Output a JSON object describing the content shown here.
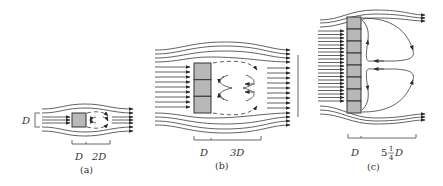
{
  "figure": {
    "panels": [
      {
        "id": "a",
        "caption": "(a)",
        "plate_cells": 1,
        "height_label": "D",
        "dim_labels": [
          "D",
          "2D"
        ],
        "wake_length": "2D"
      },
      {
        "id": "b",
        "caption": "(b)",
        "plate_cells": 3,
        "dim_labels": [
          "D",
          "3D"
        ],
        "wake_length": "3D"
      },
      {
        "id": "c",
        "caption": "(c)",
        "plate_cells": 8,
        "dim_labels": [
          "D",
          "5"
        ],
        "frac_num": "1",
        "frac_den": "4",
        "frac_suffix": "D",
        "wake_length": "5 1/4 D"
      }
    ]
  },
  "colors": {
    "plate_fill": "#b8b8b8",
    "line": "#3a3a3a",
    "background": "#ffffff"
  }
}
